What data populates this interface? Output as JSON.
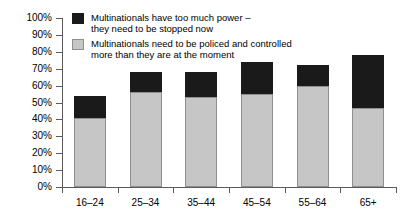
{
  "chart_data": {
    "type": "bar",
    "subtype": "stacked-vertical",
    "title": "",
    "subtitle": "",
    "xlabel": "",
    "ylabel": "",
    "categories": [
      "16–24",
      "25–34",
      "35–44",
      "45–54",
      "55–64",
      "65+"
    ],
    "series": [
      {
        "name": "Multinationals need to be policed and controlled more than they are at the moment",
        "color": "#c6c6c6",
        "values": [
          41,
          56,
          53,
          55,
          60,
          47
        ]
      },
      {
        "name": "Multinationals have too much power – they need to be stopped now",
        "color": "#1a1a1a",
        "values": [
          13,
          12,
          15,
          19,
          12,
          31
        ]
      }
    ],
    "totals": [
      54,
      68,
      68,
      74,
      72,
      78
    ],
    "ylim": [
      0,
      100
    ],
    "ytick_values": [
      0,
      10,
      20,
      30,
      40,
      50,
      60,
      70,
      80,
      90,
      100
    ],
    "ytick_labels": [
      "0%",
      "10%",
      "20%",
      "30%",
      "40%",
      "50%",
      "60%",
      "70%",
      "80%",
      "90%",
      "100%"
    ],
    "grid": false,
    "legend_position": "top-left-inside",
    "value_suffix": "%"
  },
  "legend": {
    "items": [
      {
        "swatch": "dark",
        "line1": "Multinationals have too much power –",
        "line2": "they need to be stopped now"
      },
      {
        "swatch": "light",
        "line1": "Multinationals need to be policed and controlled",
        "line2": "more than they are at the moment"
      }
    ]
  }
}
